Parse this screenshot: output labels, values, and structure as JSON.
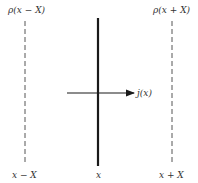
{
  "diagram": {
    "top_labels": {
      "left": "ρ(x − X)",
      "right": "ρ(x + X)"
    },
    "bottom_labels": {
      "left": "x − X",
      "center": "x",
      "right": "x + X"
    },
    "arrow_label": "j(x)",
    "colors": {
      "line": "#1a1a1a",
      "dashed": "#555555",
      "text": "#333333"
    }
  }
}
